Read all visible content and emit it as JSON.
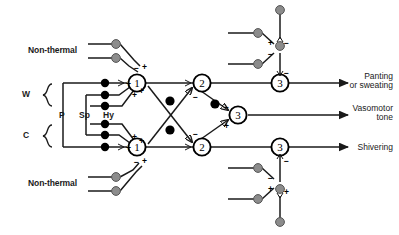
{
  "diagram": {
    "colors": {
      "line": "#1a1a1a",
      "node_fill": "#ffffff",
      "node_stroke": "#000000",
      "black_dot": "#000000",
      "gray_dot": "#8c8c8c",
      "gray_dot_stroke": "#555555",
      "background": "#ffffff",
      "text": "#1a1a1a"
    },
    "inputs": {
      "nonthermal_top_label": "Non-thermal",
      "nonthermal_bottom_label": "Non-thermal",
      "warm_label": "W",
      "cold_label": "C",
      "bracket_labels": [
        "P",
        "Sp",
        "Hy"
      ]
    },
    "nodes": {
      "stage1": [
        "1",
        "1"
      ],
      "stage2": [
        "2",
        "2"
      ],
      "stage3": [
        "3",
        "3",
        "3"
      ]
    },
    "signs": {
      "plus": "+",
      "minus": "−"
    },
    "outputs": [
      {
        "line1": "Panting",
        "line2": "or sweating"
      },
      {
        "line1": "Vasomotor",
        "line2": "tone"
      },
      {
        "line1": "Shivering",
        "line2": ""
      }
    ]
  }
}
